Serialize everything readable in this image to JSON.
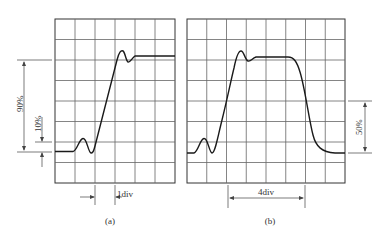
{
  "figure": {
    "panels": [
      {
        "id": "a",
        "caption": "(a)",
        "grid": {
          "columns": 6,
          "rows": 8
        },
        "waveform": "step response with pre-shoot ringing and overshoot",
        "annotations": {
          "level_high": "90%",
          "level_low": "10%",
          "time_interval": "1div"
        }
      },
      {
        "id": "b",
        "caption": "(b)",
        "grid": {
          "columns": 8,
          "rows": 8
        },
        "waveform": "pulse with pre-shoot ringing, overshoot, flat top and falling edge",
        "annotations": {
          "level_mid": "50%",
          "time_interval": "4div"
        }
      }
    ]
  },
  "colors": {
    "grid": "#555555",
    "trace": "#1a1a1a",
    "annotation": "#444444"
  }
}
